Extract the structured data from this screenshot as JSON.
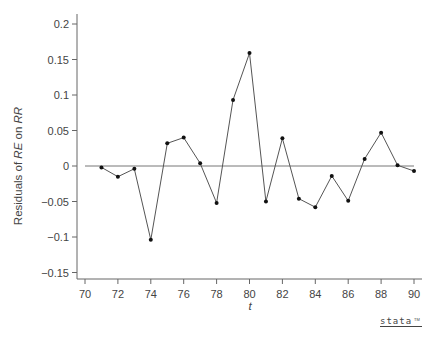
{
  "chart_data": {
    "type": "line",
    "title": "",
    "xlabel": "t",
    "ylabel": "Residuals of RE on RR",
    "ylabel_parts": [
      {
        "text": "Residuals of ",
        "italic": false
      },
      {
        "text": "RE",
        "italic": true
      },
      {
        "text": " on ",
        "italic": false
      },
      {
        "text": "RR",
        "italic": true
      }
    ],
    "x": [
      71,
      72,
      73,
      74,
      75,
      76,
      77,
      78,
      79,
      80,
      81,
      82,
      83,
      84,
      85,
      86,
      87,
      88,
      89,
      90
    ],
    "series": [
      {
        "name": "Residuals",
        "values": [
          -0.002,
          -0.015,
          -0.004,
          -0.104,
          0.032,
          0.04,
          0.004,
          -0.052,
          0.093,
          0.159,
          -0.05,
          0.039,
          -0.046,
          -0.058,
          -0.014,
          -0.049,
          0.01,
          0.047,
          0.001,
          -0.007
        ],
        "marker": "filled-circle",
        "color": "#111111"
      }
    ],
    "reference_line": {
      "y": 0,
      "x_from": 70,
      "x_to": 90
    },
    "xlim": [
      69.5,
      90.5
    ],
    "ylim": [
      -0.16,
      0.21
    ],
    "xticks": [
      70,
      72,
      74,
      76,
      78,
      80,
      82,
      84,
      86,
      88,
      90
    ],
    "xtick_labels": [
      "70",
      "72",
      "74",
      "76",
      "78",
      "80",
      "82",
      "84",
      "86",
      "88",
      "90"
    ],
    "yticks": [
      0.2,
      0.15,
      0.1,
      0.05,
      0,
      -0.05,
      -0.1,
      -0.15
    ],
    "ytick_labels": [
      "0.2",
      "0.15",
      "0.1",
      "0.05",
      "0",
      "−0.05",
      "−0.1",
      "−0.15"
    ],
    "grid": false,
    "legend": null
  },
  "watermark": {
    "label": "stata",
    "trademark": "TM"
  }
}
